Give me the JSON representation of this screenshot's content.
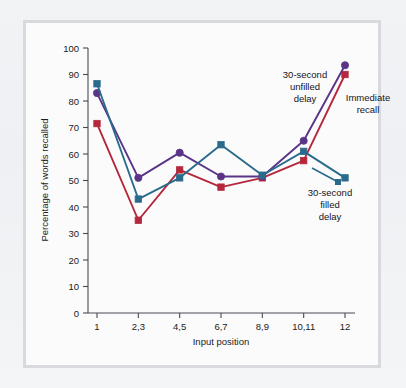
{
  "figure": {
    "frame_color": "#d9dadd",
    "plot_background": "#fbfbfc",
    "page_background": "#f1f2f4"
  },
  "chart_data": {
    "type": "line",
    "title": "",
    "xlabel": "Input position",
    "ylabel": "Percentage of words recalled",
    "categories": [
      "1",
      "2,3",
      "4,5",
      "6,7",
      "8,9",
      "10,11",
      "12"
    ],
    "xtick_labels": [
      "1",
      "2,3",
      "4,5",
      "6,7",
      "8,9",
      "10,11",
      "12"
    ],
    "ytick_labels": [
      "0",
      "10",
      "20",
      "30",
      "40",
      "50",
      "60",
      "70",
      "80",
      "90",
      "100"
    ],
    "ytick_values": [
      0,
      10,
      20,
      30,
      40,
      50,
      60,
      70,
      80,
      90,
      100
    ],
    "ylim": [
      0,
      100
    ],
    "grid": false,
    "legend_position": "inline-annotations",
    "series": [
      {
        "name": "Immediate recall",
        "color": "#b5283c",
        "marker": "square",
        "values": [
          71.5,
          35.0,
          54.0,
          47.5,
          51.0,
          57.5,
          90.0
        ]
      },
      {
        "name": "30-second unfilled delay",
        "color": "#5a3587",
        "marker": "circle",
        "values": [
          83.0,
          51.0,
          60.5,
          51.5,
          51.5,
          65.0,
          93.5
        ]
      },
      {
        "name": "30-second filled delay",
        "color": "#2a6b8c",
        "marker": "square",
        "values": [
          86.5,
          43.0,
          51.0,
          63.5,
          52.0,
          61.0,
          51.0
        ]
      }
    ],
    "annotations": [
      {
        "id": "unfilled-delay",
        "lines": [
          "30-second",
          "unfilled",
          "delay"
        ],
        "color": "#14141a",
        "points_to": "30-second unfilled delay"
      },
      {
        "id": "immediate-recall",
        "lines": [
          "Immediate",
          "recall"
        ],
        "color": "#14141a",
        "points_to": "Immediate recall"
      },
      {
        "id": "filled-delay",
        "lines": [
          "30-second",
          "filled",
          "delay"
        ],
        "color": "#14141a",
        "points_to": "30-second filled delay"
      }
    ]
  }
}
